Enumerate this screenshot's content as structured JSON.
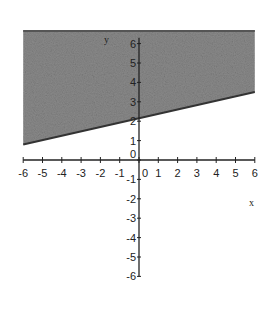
{
  "chart_data": {
    "type": "area",
    "title": "",
    "xlabel": "x",
    "ylabel": "y",
    "xlim": [
      -6,
      6
    ],
    "ylim": [
      -6,
      6.7
    ],
    "grid": false,
    "legend": null,
    "x_ticks": [
      -6,
      -5,
      -4,
      -3,
      -2,
      -1,
      0,
      1,
      2,
      3,
      4,
      5,
      6
    ],
    "x_tick_labels": [
      "-6",
      "-5",
      "-4",
      "-3",
      "-2",
      "-1",
      "0",
      "1",
      "2",
      "3",
      "4",
      "5",
      "6"
    ],
    "y_ticks": [
      -6,
      -5,
      -4,
      -3,
      -2,
      -1,
      0,
      1,
      2,
      3,
      4,
      5,
      6
    ],
    "y_tick_labels": [
      "-6",
      "-5",
      "-4",
      "-3",
      "-2",
      "-1",
      "0",
      "1",
      "2",
      "3",
      "4",
      "5",
      "6"
    ],
    "boundary_line": {
      "description": "lower boundary of shaded region",
      "slope": 0.22,
      "intercept": 2.2,
      "points": [
        [
          -6,
          0.8
        ],
        [
          0,
          2.2
        ],
        [
          6,
          3.5
        ]
      ]
    },
    "shaded_region": {
      "description": "region above the boundary line, x from -6 to 6, up to y≈6.7",
      "polygon": [
        [
          -6,
          0.8
        ],
        [
          6,
          3.5
        ],
        [
          6,
          6.7
        ],
        [
          -6,
          6.7
        ]
      ],
      "fill": "#8a8a8a"
    }
  },
  "labels": {
    "x_axis": "x",
    "y_axis": "y"
  },
  "colors": {
    "axis": "#222222",
    "shade": "#8a8a8a",
    "boundary": "#333333"
  }
}
